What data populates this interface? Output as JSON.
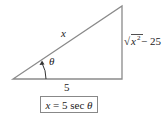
{
  "diagram": {
    "type": "right-triangle",
    "labels": {
      "hypotenuse": "x",
      "angle": "θ",
      "adjacent": "5",
      "opposite_radical": "√",
      "opposite_var": "x",
      "opposite_exp": "2",
      "opposite_rest": " − 25"
    },
    "formula": {
      "lhs": "x",
      "eq": " = 5 sec ",
      "rhs": "θ"
    },
    "colors": {
      "line": "#888888",
      "text": "#222222"
    }
  }
}
